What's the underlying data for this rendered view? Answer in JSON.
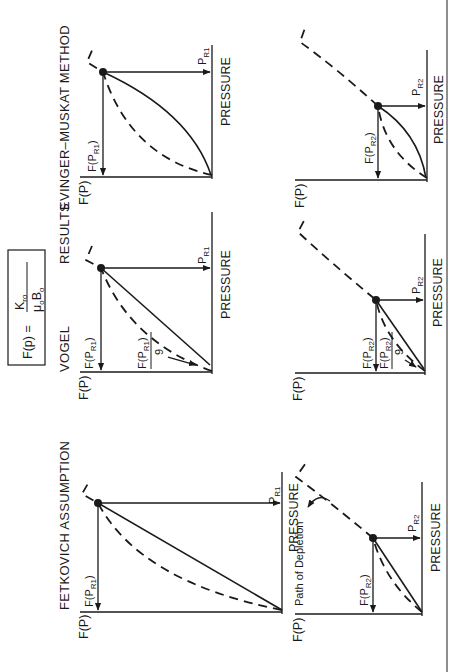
{
  "figure": {
    "orientation": "rotated 90 degrees counter-clockwise",
    "formula": {
      "lhs": "F(p) =",
      "numerator": "K",
      "numerator_sub": "ro",
      "denominator_mu": "μ",
      "denominator_mu_sub": "o",
      "denominator_b": "B",
      "denominator_b_sub": "o"
    },
    "columns": [
      {
        "title": "FETKOVICH ASSUMPTION"
      },
      {
        "title_left": "VOGEL",
        "title_right": "RESULTS"
      },
      {
        "title": "EVINGER–MUSKAT METHOD"
      }
    ],
    "axis": {
      "y_label": "F(P)",
      "x_label": "PRESSURE"
    },
    "panels": [
      {
        "id": "fetkovich-pr1",
        "column": 0,
        "row": 0,
        "pressure_label": "P",
        "pressure_sub": "R1",
        "f_label": "F(P",
        "f_sub": "R1",
        "f_close": ")",
        "solid": "straight",
        "annotation": ""
      },
      {
        "id": "vogel-pr1",
        "column": 1,
        "row": 0,
        "pressure_label": "P",
        "pressure_sub": "R1",
        "f_label": "F(P",
        "f_sub": "R1",
        "f_close": ")",
        "solid": "straight",
        "fraction_num": "F(P",
        "fraction_num_sub": "R1",
        "fraction_den": "9"
      },
      {
        "id": "evinger-pr1",
        "column": 2,
        "row": 0,
        "pressure_label": "P",
        "pressure_sub": "R1",
        "f_label": "F(P",
        "f_sub": "R1",
        "f_close": ")",
        "solid": "convex"
      },
      {
        "id": "fetkovich-pr2",
        "column": 0,
        "row": 1,
        "pressure_label": "P",
        "pressure_sub": "R2",
        "f_label": "F(P",
        "f_sub": "R2",
        "f_close": ")",
        "solid": "straight",
        "annotation": "Path of Depletion"
      },
      {
        "id": "vogel-pr2",
        "column": 1,
        "row": 1,
        "pressure_label": "P",
        "pressure_sub": "R2",
        "f_label": "F(P",
        "f_sub": "R2",
        "f_close": ")",
        "solid": "straight",
        "fraction_num": "F(P",
        "fraction_num_sub": "R2",
        "fraction_den": "9"
      },
      {
        "id": "evinger-pr2",
        "column": 2,
        "row": 1,
        "pressure_label": "P",
        "pressure_sub": "R2",
        "f_label": "F(P",
        "f_sub": "R2",
        "f_close": ")",
        "solid": "convex"
      }
    ]
  },
  "colors": {
    "ink": "#1a1a1a",
    "paper": "#ffffff"
  }
}
